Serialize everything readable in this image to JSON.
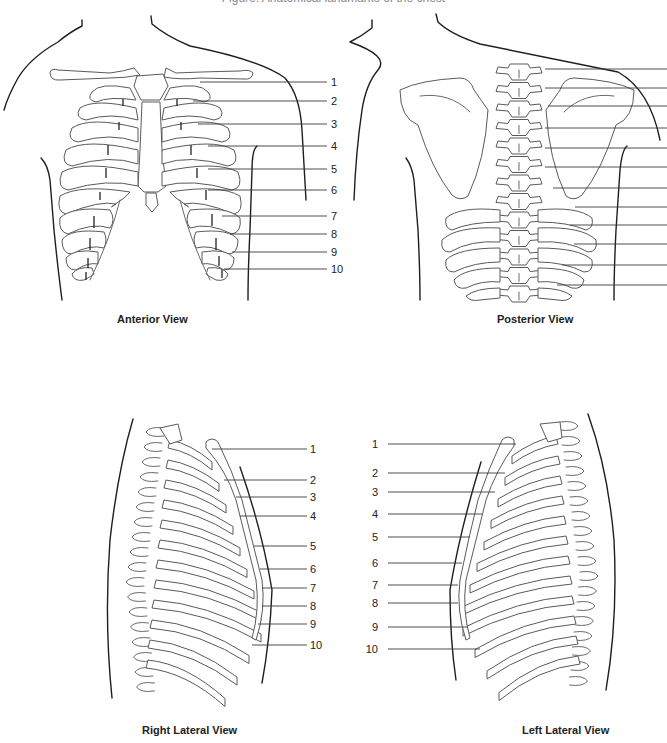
{
  "figure": {
    "title_clipped": "Figure: Anatomical landmarks of the chest"
  },
  "views": {
    "anterior": {
      "caption": "Anterior View",
      "caption_pos": [
        117,
        320
      ],
      "labels": [
        {
          "n": "1",
          "y": 82,
          "x1": 200
        },
        {
          "n": "2",
          "y": 101,
          "x1": 193
        },
        {
          "n": "3",
          "y": 124,
          "x1": 198
        },
        {
          "n": "4",
          "y": 146,
          "x1": 208
        },
        {
          "n": "5",
          "y": 169,
          "x1": 208
        },
        {
          "n": "6",
          "y": 190,
          "x1": 208
        },
        {
          "n": "7",
          "y": 216,
          "x1": 222
        },
        {
          "n": "8",
          "y": 234,
          "x1": 230
        },
        {
          "n": "9",
          "y": 252,
          "x1": 232
        },
        {
          "n": "10",
          "y": 269,
          "x1": 224
        }
      ],
      "label_x2": 327,
      "num_x": 331
    },
    "posterior": {
      "caption": "Posterior View",
      "caption_pos": [
        497,
        320
      ],
      "labels": [
        {
          "n": "",
          "y": 69,
          "x1": 545
        },
        {
          "n": "",
          "y": 88,
          "x1": 545
        },
        {
          "n": "",
          "y": 106,
          "x1": 548
        },
        {
          "n": "",
          "y": 128,
          "x1": 545
        },
        {
          "n": "",
          "y": 148,
          "x1": 545
        },
        {
          "n": "",
          "y": 167,
          "x1": 545
        },
        {
          "n": "",
          "y": 188,
          "x1": 553
        },
        {
          "n": "",
          "y": 207,
          "x1": 575
        },
        {
          "n": "",
          "y": 225,
          "x1": 570
        },
        {
          "n": "",
          "y": 244,
          "x1": 574
        },
        {
          "n": "",
          "y": 265,
          "x1": 562
        },
        {
          "n": "",
          "y": 285,
          "x1": 557
        }
      ],
      "label_x2": 667
    },
    "right_lateral": {
      "caption": "Right Lateral View",
      "caption_pos": [
        142,
        731
      ],
      "labels": [
        {
          "n": "1",
          "y": 449,
          "x1": 212
        },
        {
          "n": "2",
          "y": 480,
          "x1": 224
        },
        {
          "n": "3",
          "y": 497,
          "x1": 236
        },
        {
          "n": "4",
          "y": 516,
          "x1": 240
        },
        {
          "n": "5",
          "y": 546,
          "x1": 254
        },
        {
          "n": "6",
          "y": 569,
          "x1": 260
        },
        {
          "n": "7",
          "y": 588,
          "x1": 262
        },
        {
          "n": "8",
          "y": 606,
          "x1": 262
        },
        {
          "n": "9",
          "y": 624,
          "x1": 258
        },
        {
          "n": "10",
          "y": 645,
          "x1": 252
        }
      ],
      "label_x2": 307,
      "num_x": 310
    },
    "left_lateral": {
      "caption": "Left Lateral View",
      "caption_pos": [
        522,
        731
      ],
      "labels": [
        {
          "n": "1",
          "y": 444,
          "x2": 516
        },
        {
          "n": "2",
          "y": 473,
          "x2": 505
        },
        {
          "n": "3",
          "y": 492,
          "x2": 495
        },
        {
          "n": "4",
          "y": 514,
          "x2": 482
        },
        {
          "n": "5",
          "y": 537,
          "x2": 470
        },
        {
          "n": "6",
          "y": 563,
          "x2": 462
        },
        {
          "n": "7",
          "y": 585,
          "x2": 458
        },
        {
          "n": "8",
          "y": 603,
          "x2": 458
        },
        {
          "n": "9",
          "y": 627,
          "x2": 468
        },
        {
          "n": "10",
          "y": 649,
          "x2": 480
        }
      ],
      "label_x1": 388,
      "num_x": 378
    }
  }
}
